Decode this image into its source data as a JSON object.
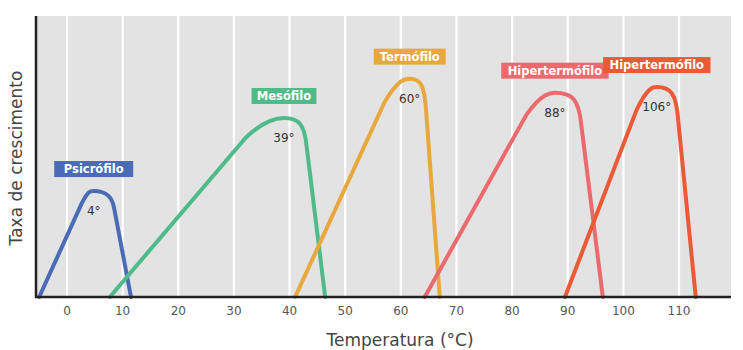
{
  "chart_data": {
    "type": "line",
    "title": "",
    "xlabel": "Temperatura (°C)",
    "ylabel": "Taxa de crescimento",
    "xlim": [
      -6,
      119
    ],
    "ylim": [
      0,
      100
    ],
    "x_ticks": [
      0,
      10,
      20,
      30,
      40,
      50,
      60,
      70,
      80,
      90,
      100,
      110
    ],
    "grid": "vertical",
    "legend": "inline labels above each curve",
    "series": [
      {
        "name": "Psicrófilo",
        "color": "#4a6bb5",
        "optimum_label": "4°",
        "min": -5,
        "optimum": 4.8,
        "max": 11.5,
        "peak_rate": 37
      },
      {
        "name": "Mesófilo",
        "color": "#4fba8a",
        "optimum_label": "39°",
        "min": 7.7,
        "optimum": 39,
        "max": 46.4,
        "peak_rate": 63
      },
      {
        "name": "Termófilo",
        "color": "#e8a83e",
        "optimum_label": "60°",
        "min": 41,
        "optimum": 61.6,
        "max": 67,
        "peak_rate": 77
      },
      {
        "name": "Hipertermófilo",
        "color": "#ea6a6e",
        "optimum_label": "88°",
        "min": 64.3,
        "optimum": 87.7,
        "max": 96.3,
        "peak_rate": 72
      },
      {
        "name": "Hipertermófilo",
        "color": "#eb5a36",
        "optimum_label": "106°",
        "min": 89.5,
        "optimum": 106,
        "max": 113,
        "peak_rate": 74
      }
    ]
  },
  "colors": {
    "plot_bg": "#e3e3e3",
    "grid": "#ffffff",
    "axis": "#222222",
    "tick_text": "#555555"
  }
}
